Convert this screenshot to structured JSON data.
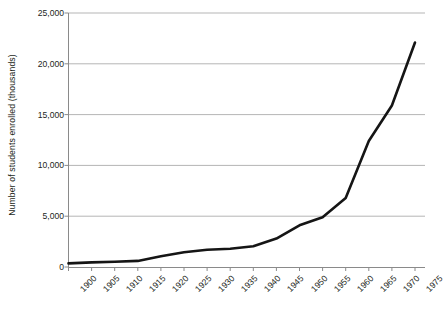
{
  "chart_data": {
    "type": "line",
    "title": "",
    "xlabel": "",
    "ylabel": "Number of students enrolled (thousands)",
    "x": [
      1900,
      1905,
      1910,
      1915,
      1920,
      1925,
      1930,
      1935,
      1940,
      1945,
      1950,
      1955,
      1960,
      1965,
      1970,
      1975
    ],
    "values": [
      350,
      450,
      520,
      600,
      1050,
      1450,
      1700,
      1800,
      2050,
      2800,
      4100,
      4900,
      6800,
      12400,
      15900,
      22100
    ],
    "series": [
      {
        "name": "Number of students enrolled (thousands)",
        "values": [
          350,
          450,
          520,
          600,
          1050,
          1450,
          1700,
          1800,
          2050,
          2800,
          4100,
          4900,
          6800,
          12400,
          15900,
          22100
        ]
      }
    ],
    "categories": [
      "1900",
      "1905",
      "1910",
      "1915",
      "1920",
      "1925",
      "1930",
      "1935",
      "1940",
      "1945",
      "1950",
      "1955",
      "1960",
      "1965",
      "1970",
      "1975"
    ],
    "xtick_labels": [
      "1900",
      "1905",
      "1910",
      "1915",
      "1920",
      "1925",
      "1930",
      "1935",
      "1940",
      "1945",
      "1950",
      "1955",
      "1960",
      "1965",
      "1970",
      "1975"
    ],
    "ytick_labels": [
      "0",
      "5,000",
      "10,000",
      "15,000",
      "20,000",
      "25,000"
    ],
    "ytick_values": [
      0,
      5000,
      10000,
      15000,
      20000,
      25000
    ],
    "ylim": [
      0,
      25000
    ],
    "xlim": [
      1900,
      1975
    ],
    "grid": true,
    "grid_axis": "y",
    "legend": false,
    "legend_position": "none",
    "xtick_label_rotation": -45,
    "colors": {
      "line": "#151515",
      "grid": "#b5b5b5",
      "axis": "#8a8a8a",
      "text": "#231f20",
      "background": "#ffffff"
    }
  }
}
